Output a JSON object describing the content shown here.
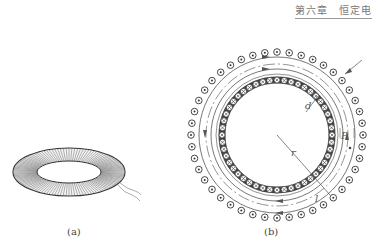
{
  "header": {
    "running_title": "第六章　恒定电"
  },
  "figures": [
    {
      "id": "a",
      "caption": "(a)",
      "description": "toroidal coil winding perspective drawing"
    },
    {
      "id": "b",
      "caption": "(b)",
      "description": "cross-section of toroidal solenoid",
      "labels": {
        "d": "d",
        "r": "r",
        "P": "P",
        "l": "l"
      },
      "outer_conductor_symbol": "dot (current out of page)",
      "inner_conductor_symbol": "cross (current into page)"
    }
  ],
  "colors": {
    "line": "#555555",
    "dark": "#333333",
    "light_line": "#888888",
    "background": "#ffffff"
  }
}
